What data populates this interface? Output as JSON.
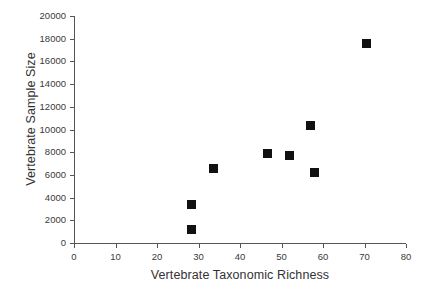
{
  "chart_data": {
    "type": "scatter",
    "title": "",
    "xlabel": "Vertebrate Taxonomic Richness",
    "ylabel": "Vertebrate Sample Size",
    "xlim": [
      0,
      80
    ],
    "ylim": [
      0,
      20000
    ],
    "grid": false,
    "legend": null,
    "marker": {
      "shape": "square",
      "color": "#111111",
      "size_px": 9
    },
    "xticks": [
      0,
      10,
      20,
      30,
      40,
      50,
      60,
      70,
      80
    ],
    "xtick_labels": [
      "0",
      "10",
      "20",
      "30",
      "40",
      "50",
      "60",
      "70",
      "80"
    ],
    "yticks": [
      0,
      2000,
      4000,
      6000,
      8000,
      10000,
      12000,
      14000,
      16000,
      18000,
      20000
    ],
    "ytick_labels": [
      "0",
      "2000",
      "4000",
      "6000",
      "8000",
      "10000",
      "12000",
      "14000",
      "16000",
      "18000",
      "20000"
    ],
    "points": [
      {
        "x": 28.2,
        "y": 1180
      },
      {
        "x": 28.4,
        "y": 3380
      },
      {
        "x": 33.5,
        "y": 6580
      },
      {
        "x": 46.7,
        "y": 7890
      },
      {
        "x": 52.0,
        "y": 7720
      },
      {
        "x": 57.1,
        "y": 10370
      },
      {
        "x": 58.0,
        "y": 6230
      },
      {
        "x": 70.4,
        "y": 17550
      }
    ],
    "axis_color": "#555555",
    "text_color": "#3a3a3a",
    "background": "#ffffff"
  }
}
